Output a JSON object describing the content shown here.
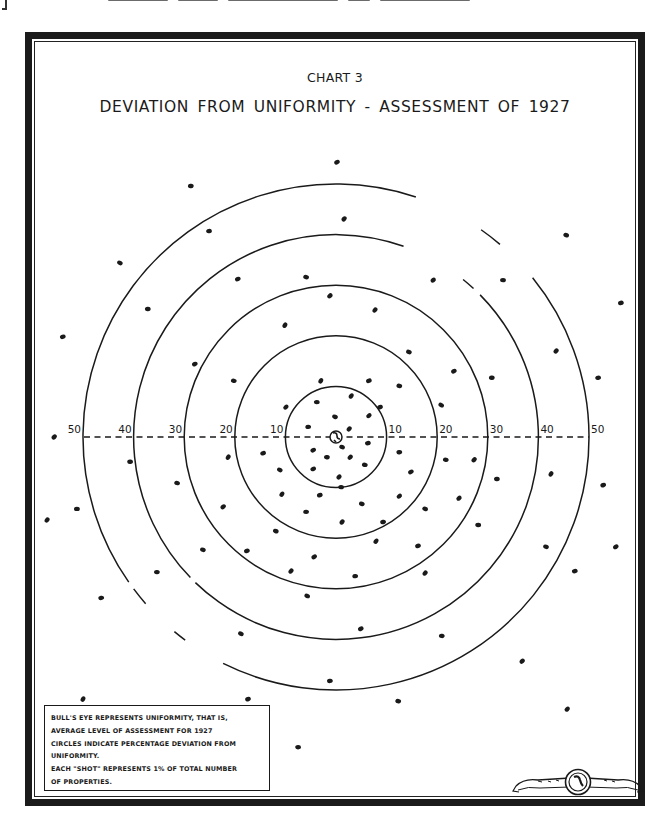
{
  "document": {
    "chart_number": "CHART 3",
    "title": "DEVIATION FROM UNIFORMITY - ASSESSMENT OF 1927",
    "legend_lines": [
      "BULL'S EYE REPRESENTS UNIFORMITY, THAT IS,",
      "AVERAGE LEVEL OF ASSESSMENT FOR 1927",
      "CIRCLES INDICATE PERCENTAGE DEVIATION FROM",
      "UNIFORMITY.",
      "EACH \"SHOT\" REPRESENTS 1% OF TOTAL NUMBER",
      "OF PROPERTIES."
    ],
    "emblem_icon": "seal-ribbon-icon"
  },
  "colors": {
    "ink": "#1a1a1a",
    "paper": "#ffffff"
  },
  "chart_data": {
    "type": "scatter",
    "subtype": "bullseye-target",
    "title": "DEVIATION FROM UNIFORMITY - ASSESSMENT OF 1927",
    "subtitle": "CHART 3",
    "xlabel": "",
    "ylabel": "",
    "units": "percent deviation from average level of assessment",
    "ring_values": [
      10,
      20,
      30,
      40,
      50
    ],
    "axis": {
      "orientation": "horizontal dashed line through center",
      "left_tick_labels": [
        "50",
        "40",
        "30",
        "20",
        "10"
      ],
      "right_tick_labels": [
        "10",
        "20",
        "30",
        "40",
        "50"
      ],
      "range": [
        -50,
        50
      ]
    },
    "grid": false,
    "legend_position": "bottom-left box",
    "ring_gaps_deg": {
      "40": [
        [
          -70.5,
          -51.1
        ],
        [
          -47.2,
          -44.6
        ],
        [
          134,
          136
        ]
      ],
      "50": [
        [
          -71.6,
          -55
        ],
        [
          -49.6,
          -39
        ],
        [
          116.5,
          126.6
        ],
        [
          129.7,
          138.8
        ],
        [
          143.1,
          145
        ]
      ]
    },
    "center_marker": "bull's eye (uniformity)",
    "points_note": "each point = 1% of total number of properties; coordinates are (dx, dy) in percent-deviation units from center, dy positive downward",
    "points": [
      [
        -3.0,
        -11.1
      ],
      [
        6.5,
        -11.1
      ],
      [
        12.5,
        -10.1
      ],
      [
        -9.9,
        -5.9
      ],
      [
        -3.8,
        -6.9
      ],
      [
        3.0,
        -8.1
      ],
      [
        8.7,
        -5.9
      ],
      [
        -0.2,
        -4.0
      ],
      [
        6.5,
        -4.2
      ],
      [
        -5.5,
        -2.0
      ],
      [
        2.6,
        -1.6
      ],
      [
        6.3,
        1.2
      ],
      [
        1.2,
        2.0
      ],
      [
        -4.5,
        2.6
      ],
      [
        -1.8,
        4.0
      ],
      [
        2.8,
        4.0
      ],
      [
        12.5,
        3.0
      ],
      [
        -11.1,
        6.5
      ],
      [
        -4.5,
        6.3
      ],
      [
        5.7,
        5.5
      ],
      [
        0.6,
        7.9
      ],
      [
        1.0,
        9.9
      ],
      [
        -10.7,
        11.3
      ],
      [
        -3.2,
        11.5
      ],
      [
        5.1,
        13.2
      ],
      [
        12.5,
        11.7
      ],
      [
        -5.9,
        14.8
      ],
      [
        1.2,
        16.8
      ],
      [
        9.3,
        16.8
      ],
      [
        -11.9,
        18.6
      ],
      [
        0.2,
        -54.3
      ],
      [
        -28.7,
        -49.6
      ],
      [
        1.6,
        -43.1
      ],
      [
        -25.1,
        -40.7
      ],
      [
        -42.7,
        -34.4
      ],
      [
        -19.4,
        -31.2
      ],
      [
        -5.9,
        -31.6
      ],
      [
        -1.2,
        -27.9
      ],
      [
        -37.2,
        -25.3
      ],
      [
        -10.1,
        -22.1
      ],
      [
        -54.0,
        -19.8
      ],
      [
        45.5,
        -39.9
      ],
      [
        19.2,
        -31.0
      ],
      [
        33.0,
        -31.0
      ],
      [
        7.7,
        -25.1
      ],
      [
        56.3,
        -26.5
      ],
      [
        14.4,
        -16.8
      ],
      [
        23.3,
        -13.0
      ],
      [
        30.8,
        -11.7
      ],
      [
        43.5,
        -17.0
      ],
      [
        51.8,
        -11.7
      ],
      [
        20.8,
        -6.3
      ],
      [
        -27.9,
        -14.4
      ],
      [
        -20.2,
        -11.1
      ],
      [
        -55.7,
        0.0
      ],
      [
        -40.7,
        4.9
      ],
      [
        -21.3,
        4.0
      ],
      [
        -14.4,
        3.2
      ],
      [
        -31.4,
        9.1
      ],
      [
        -22.3,
        13.8
      ],
      [
        -51.2,
        14.2
      ],
      [
        -57.1,
        16.4
      ],
      [
        -17.6,
        22.5
      ],
      [
        -26.3,
        22.3
      ],
      [
        -4.3,
        23.7
      ],
      [
        -35.4,
        26.7
      ],
      [
        -8.9,
        26.5
      ],
      [
        -46.4,
        31.8
      ],
      [
        -5.7,
        31.4
      ],
      [
        14.8,
        6.9
      ],
      [
        21.7,
        4.5
      ],
      [
        27.3,
        4.5
      ],
      [
        31.8,
        8.3
      ],
      [
        42.5,
        7.3
      ],
      [
        52.8,
        9.5
      ],
      [
        17.6,
        14.2
      ],
      [
        24.3,
        12.1
      ],
      [
        28.1,
        17.4
      ],
      [
        7.9,
        20.6
      ],
      [
        16.2,
        21.5
      ],
      [
        41.5,
        21.7
      ],
      [
        55.3,
        21.7
      ],
      [
        3.8,
        27.5
      ],
      [
        17.6,
        26.9
      ],
      [
        47.2,
        26.5
      ],
      [
        -18.8,
        38.9
      ],
      [
        4.9,
        37.9
      ],
      [
        20.9,
        39.3
      ],
      [
        36.8,
        44.3
      ],
      [
        -1.2,
        48.2
      ],
      [
        -50.0,
        51.8
      ],
      [
        -17.4,
        51.8
      ],
      [
        12.3,
        52.2
      ],
      [
        45.7,
        53.8
      ],
      [
        -7.5,
        61.3
      ]
    ]
  }
}
